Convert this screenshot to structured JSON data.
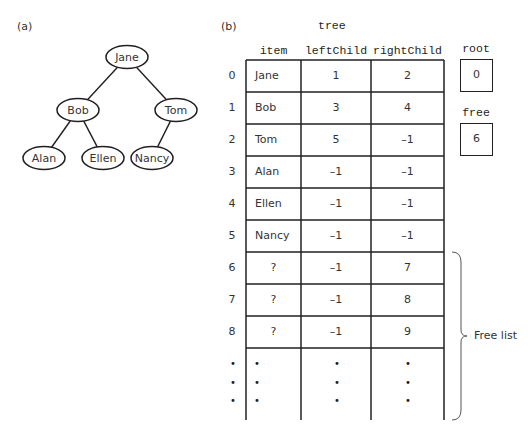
{
  "panel_a": {
    "label": "(a)",
    "tree": {
      "nodes": [
        {
          "id": "jane",
          "label": "Jane",
          "cx": 127,
          "cy": 57
        },
        {
          "id": "bob",
          "label": "Bob",
          "cx": 78,
          "cy": 110
        },
        {
          "id": "tom",
          "label": "Tom",
          "cx": 176,
          "cy": 110
        },
        {
          "id": "alan",
          "label": "Alan",
          "cx": 44,
          "cy": 158
        },
        {
          "id": "ellen",
          "label": "Ellen",
          "cx": 103,
          "cy": 158
        },
        {
          "id": "nancy",
          "label": "Nancy",
          "cx": 152,
          "cy": 158
        }
      ],
      "edges": [
        [
          "jane",
          "bob"
        ],
        [
          "jane",
          "tom"
        ],
        [
          "bob",
          "alan"
        ],
        [
          "bob",
          "ellen"
        ],
        [
          "tom",
          "nancy"
        ]
      ]
    }
  },
  "panel_b": {
    "label": "(b)",
    "array_name": "tree",
    "columns": [
      "item",
      "leftChild",
      "rightChild"
    ],
    "rows": [
      {
        "index": "0",
        "item": "Jane",
        "leftChild": "1",
        "rightChild": "2"
      },
      {
        "index": "1",
        "item": "Bob",
        "leftChild": "3",
        "rightChild": "4"
      },
      {
        "index": "2",
        "item": "Tom",
        "leftChild": "5",
        "rightChild": "–1"
      },
      {
        "index": "3",
        "item": "Alan",
        "leftChild": "–1",
        "rightChild": "–1"
      },
      {
        "index": "4",
        "item": "Ellen",
        "leftChild": "–1",
        "rightChild": "–1"
      },
      {
        "index": "5",
        "item": "Nancy",
        "leftChild": "–1",
        "rightChild": "–1"
      },
      {
        "index": "6",
        "item": "?",
        "leftChild": "–1",
        "rightChild": "7"
      },
      {
        "index": "7",
        "item": "?",
        "leftChild": "–1",
        "rightChild": "8"
      },
      {
        "index": "8",
        "item": "?",
        "leftChild": "–1",
        "rightChild": "9"
      }
    ],
    "ellipsis": "•",
    "root": {
      "label": "root",
      "value": "0"
    },
    "free": {
      "label": "free",
      "value": "6"
    },
    "free_list_label": "Free list"
  }
}
